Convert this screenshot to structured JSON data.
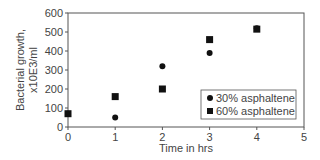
{
  "chart_data": {
    "type": "scatter",
    "title": "",
    "xlabel": "Time in hrs",
    "ylabel": "Bacterial growth, x10E3/ml",
    "ylabel_lines": [
      "Bacterial growth,",
      "x10E3/ml"
    ],
    "xlim": [
      0,
      5
    ],
    "ylim": [
      0,
      600
    ],
    "xticks": [
      0,
      1,
      2,
      3,
      4,
      5
    ],
    "yticks": [
      0,
      100,
      200,
      300,
      400,
      500,
      600
    ],
    "grid": false,
    "legend_position": "lower right",
    "x": [
      0,
      1,
      2,
      3,
      4
    ],
    "series": [
      {
        "name": "30% asphaltene",
        "marker": "circle",
        "values": [
          70,
          50,
          320,
          390,
          520
        ]
      },
      {
        "name": "60% asphaltene",
        "marker": "square",
        "values": [
          70,
          160,
          200,
          460,
          515
        ]
      }
    ]
  }
}
